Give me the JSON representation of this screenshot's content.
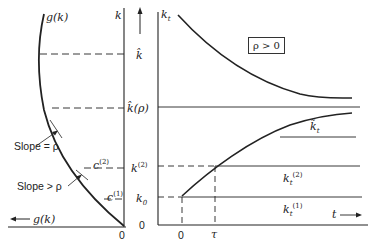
{
  "figure": {
    "left_panel": {
      "axis_label": "k",
      "curve_label": "g(k)",
      "x_axis_label": "g(k)",
      "origin_label": "0",
      "slope_labels": [
        "Slope = ρ",
        "Slope > ρ"
      ],
      "consumption_labels": {
        "c2": "c",
        "c2_sup": "(2)",
        "c1": "c",
        "c1_sup": "(1)"
      }
    },
    "middle_labels": {
      "k_hat": "k̂",
      "k_hat_rho": "k̂(ρ)",
      "k2": "k",
      "k2_sup": "(2)",
      "k0": "k",
      "k0_sub": "0",
      "zero": "0"
    },
    "right_panel": {
      "y_axis_label": "k",
      "y_axis_sub": "t",
      "condition_box": "ρ > 0",
      "x_axis_label": "t",
      "t_ticks": [
        "0",
        "τ"
      ],
      "path_labels": {
        "k_tilde": "k̃",
        "k_tilde_sub": "t",
        "k2": "k",
        "k2_sub": "t",
        "k2_sup": "(2)",
        "k1": "k",
        "k1_sub": "t",
        "k1_sup": "(1)"
      }
    }
  }
}
